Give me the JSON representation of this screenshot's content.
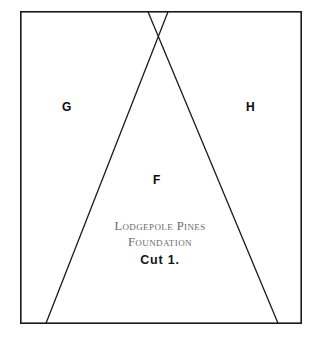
{
  "sheet": {
    "name": "lodgepole-pines-foundation-cut-1-pattern",
    "background_color": "#ffffff",
    "line_color": "#1a1a1a",
    "border": {
      "x": 20,
      "y": 11,
      "width": 282,
      "height": 313,
      "stroke_width": 1.6
    }
  },
  "pieces": [
    {
      "id": "G",
      "label": "G",
      "label_x": 62,
      "label_y": 101
    },
    {
      "id": "H",
      "label": "H",
      "label_x": 246,
      "label_y": 101
    },
    {
      "id": "F",
      "label": "F",
      "label_x": 153,
      "label_y": 174
    }
  ],
  "seam_lines": {
    "left_diagonal": {
      "x1": 168,
      "y1": 11,
      "x2": 46,
      "y2": 324
    },
    "right_diagonal": {
      "x1": 148,
      "y1": 11,
      "x2": 278,
      "y2": 324
    }
  },
  "title_block": {
    "line1": "Lodgepole Pines",
    "line2": "Foundation",
    "cut_label": "Cut 1.",
    "title_color": "#6b6b6b",
    "cut_color": "#141414"
  }
}
